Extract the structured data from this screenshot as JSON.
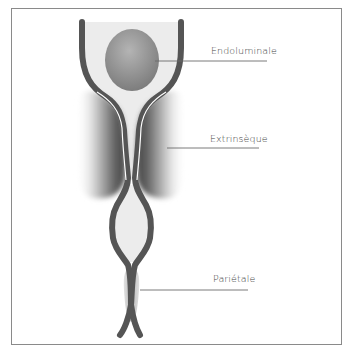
{
  "figure": {
    "type": "anatomical-schematic",
    "labels": [
      {
        "id": "endoluminale",
        "text": "Endoluminale",
        "x": 211,
        "y": 45
      },
      {
        "id": "extrinseque",
        "text": "Extrinsèque",
        "x": 210,
        "y": 133
      },
      {
        "id": "parietale",
        "text": "Pariétale",
        "x": 213,
        "y": 273
      }
    ]
  },
  "colors": {
    "wall": "#555555",
    "lumen": "#e9e9e9",
    "mass": "#8c8c8c",
    "extrinsic_mass": "#6a6a6a",
    "leader_line": "#6b6b6b",
    "frame": "#8a8a8a"
  }
}
